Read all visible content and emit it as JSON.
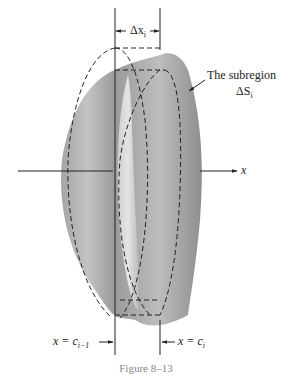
{
  "figure": {
    "caption": "Figure 8–13",
    "delta_x_label": "Δx",
    "delta_x_sub": "i",
    "subregion_label_line1": "The subregion",
    "subregion_label_line2": "ΔS",
    "subregion_label_sub": "i",
    "axis_label": "x",
    "left_bound_label": "x = c",
    "left_bound_sub": "i−1",
    "right_bound_label": "x = c",
    "right_bound_sub": "i"
  },
  "colors": {
    "surface_dark": "#8a8a8a",
    "surface_light": "#d8d8d8",
    "line": "#222222",
    "caption": "#888888"
  }
}
